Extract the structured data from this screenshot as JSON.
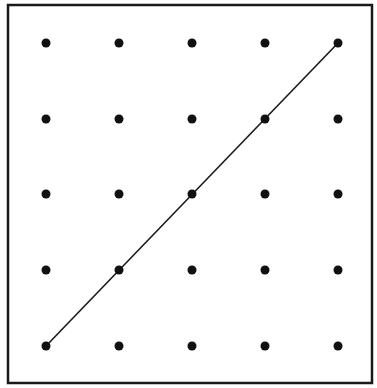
{
  "diagram": {
    "type": "dot-grid-with-line",
    "frame": {
      "x1": 8,
      "y1": 5,
      "x2": 372,
      "y2": 383,
      "stroke": "#1a1a1a",
      "stroke_width": 2.5
    },
    "grid": {
      "rows": 5,
      "cols": 5,
      "col_x": [
        46,
        119,
        192,
        265,
        338
      ],
      "row_y": [
        43,
        119,
        194,
        270,
        346
      ],
      "dot_radius": 4.5,
      "dot_color": "#111111"
    },
    "line": {
      "from": {
        "col": 0,
        "row": 4
      },
      "to": {
        "col": 4,
        "row": 0
      },
      "passes_through": [
        {
          "col": 0,
          "row": 4
        },
        {
          "col": 1,
          "row": 3
        },
        {
          "col": 2,
          "row": 2
        },
        {
          "col": 3,
          "row": 1
        },
        {
          "col": 4,
          "row": 0
        }
      ],
      "stroke": "#1a1a1a",
      "stroke_width": 1.6
    }
  }
}
